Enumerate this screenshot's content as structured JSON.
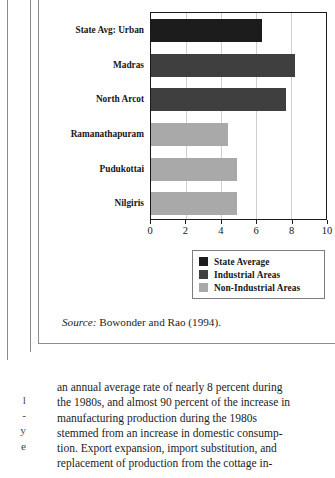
{
  "figure": {
    "source_label": "Source:",
    "source_text": " Bowonder and Rao (1994)."
  },
  "chart_data": {
    "type": "bar",
    "orientation": "horizontal",
    "title": "",
    "subtitle": "",
    "xlabel": "",
    "ylabel": "",
    "xlim": [
      0,
      10
    ],
    "xticks": [
      "0",
      "2",
      "4",
      "6",
      "8",
      "10"
    ],
    "xtick_values": [
      0,
      2,
      4,
      6,
      8,
      10
    ],
    "grid": "vertical",
    "categories": [
      "State Avg: Urban",
      "Madras",
      "North Arcot",
      "Ramanathapuram",
      "Pudukottai",
      "Nilgiris"
    ],
    "values": [
      6.35,
      8.2,
      7.7,
      4.4,
      4.9,
      4.9
    ],
    "bar_groups": [
      "State Average",
      "Industrial Areas",
      "Industrial Areas",
      "Non-Industrial Areas",
      "Non-Industrial Areas",
      "Non-Industrial Areas"
    ],
    "bar_colors": [
      "#1c1c1c",
      "#3f3f3f",
      "#3f3f3f",
      "#a9a9a9",
      "#a9a9a9",
      "#a9a9a9"
    ],
    "legend_position": "bottom-right",
    "legend": [
      {
        "label": "State Average",
        "color": "#1c1c1c"
      },
      {
        "label": "Industrial Areas",
        "color": "#3f3f3f"
      },
      {
        "label": "Non-Industrial Areas",
        "color": "#a9a9a9"
      }
    ]
  },
  "left_column_fragment": {
    "lines": [
      "l",
      "-",
      "y",
      "e"
    ]
  },
  "body_text": {
    "lines": [
      "an annual average rate of nearly 8 percent during",
      "the 1980s, and almost 90 percent of the increase in",
      "manufacturing production during the 1980s",
      "stemmed from an increase in domestic consump-",
      "tion. Export expansion, import substitution, and",
      "replacement of production from the cottage in-"
    ]
  }
}
